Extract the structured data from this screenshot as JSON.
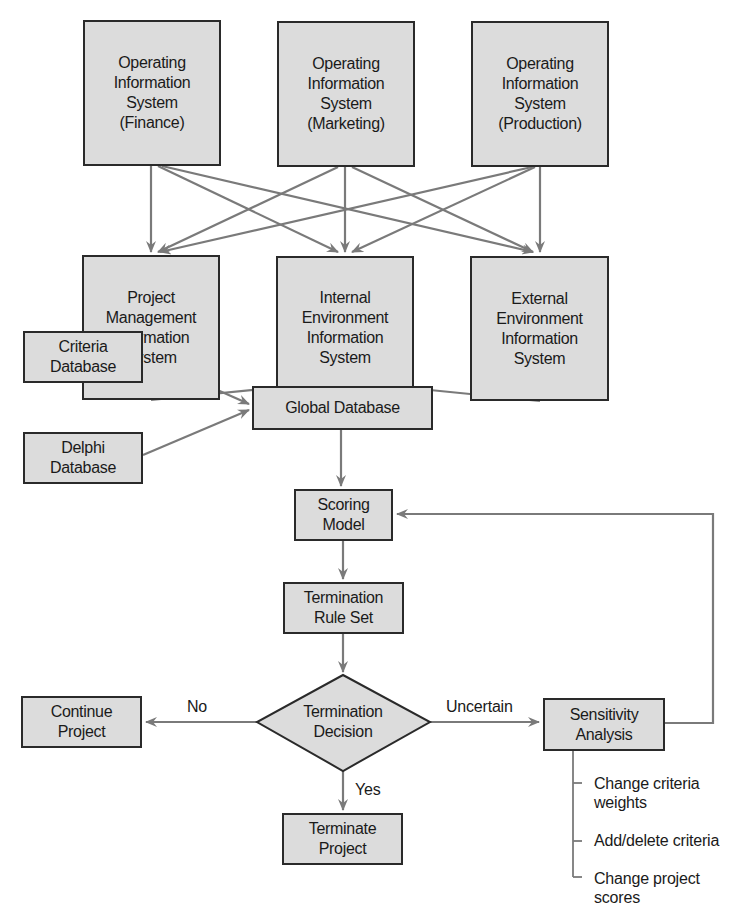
{
  "diagram": {
    "type": "flowchart",
    "colors": {
      "box_fill": "#dcdcdc",
      "box_border": "#2a2a2a",
      "arrow": "#7a7a7a",
      "text": "#1a1a1a"
    },
    "nodes": {
      "ois_finance": "Operating\nInformation\nSystem\n(Finance)",
      "ois_marketing": "Operating\nInformation\nSystem\n(Marketing)",
      "ois_production": "Operating\nInformation\nSystem\n(Production)",
      "pmis": "Project\nManagement\nInformation\nSystem",
      "ieis": "Internal\nEnvironment\nInformation\nSystem",
      "eeis": "External\nEnvironment\nInformation\nSystem",
      "criteria_db": "Criteria\nDatabase",
      "delphi_db": "Delphi\nDatabase",
      "global_db": "Global Database",
      "scoring_model": "Scoring\nModel",
      "rule_set": "Termination\nRule Set",
      "decision": "Termination\nDecision",
      "continue_project": "Continue\nProject",
      "terminate_project": "Terminate\nProject",
      "sensitivity": "Sensitivity\nAnalysis"
    },
    "edge_labels": {
      "no": "No",
      "yes": "Yes",
      "uncertain": "Uncertain"
    },
    "sensitivity_options": [
      "Change criteria\nweights",
      "Add/delete criteria",
      "Change project\nscores"
    ],
    "edges": [
      [
        "ois_finance",
        "pmis"
      ],
      [
        "ois_finance",
        "ieis"
      ],
      [
        "ois_finance",
        "eeis"
      ],
      [
        "ois_marketing",
        "pmis"
      ],
      [
        "ois_marketing",
        "ieis"
      ],
      [
        "ois_marketing",
        "eeis"
      ],
      [
        "ois_production",
        "pmis"
      ],
      [
        "ois_production",
        "ieis"
      ],
      [
        "ois_production",
        "eeis"
      ],
      [
        "pmis",
        "global_db"
      ],
      [
        "ieis",
        "global_db"
      ],
      [
        "eeis",
        "global_db"
      ],
      [
        "criteria_db",
        "global_db"
      ],
      [
        "delphi_db",
        "global_db"
      ],
      [
        "global_db",
        "scoring_model"
      ],
      [
        "scoring_model",
        "rule_set"
      ],
      [
        "rule_set",
        "decision"
      ],
      [
        "decision",
        "continue_project",
        "No"
      ],
      [
        "decision",
        "terminate_project",
        "Yes"
      ],
      [
        "decision",
        "sensitivity",
        "Uncertain"
      ],
      [
        "sensitivity",
        "scoring_model"
      ]
    ]
  }
}
